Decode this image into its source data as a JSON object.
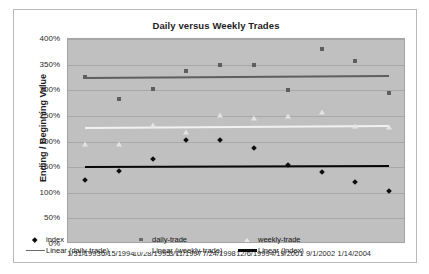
{
  "chart_data": {
    "type": "scatter",
    "title": "Daily versus Weekly Trades",
    "xlabel": "",
    "ylabel": "Ending / Beginning Value",
    "ylim": [
      0,
      400
    ],
    "yunit": "%",
    "ytick_labels": [
      "400%",
      "350%",
      "300%",
      "250%",
      "200%",
      "150%",
      "100%",
      "50%",
      "0%"
    ],
    "ytick_values": [
      400,
      350,
      300,
      250,
      200,
      150,
      100,
      50,
      0
    ],
    "xtick_labels": [
      "1/31/1993",
      "6/15/1994",
      "10/28/1995",
      "3/11/1997",
      "7/24/1998",
      "12/6/1999",
      "4/19/2001",
      "9/1/2002",
      "1/14/2004"
    ],
    "grid": true,
    "legend_position": "bottom-inside",
    "plot_background": "#c0c0c0",
    "x": [
      0.5,
      1.5,
      2.5,
      3.5,
      4.5,
      5.5,
      6.5,
      7.5,
      8.5,
      9.5
    ],
    "series": [
      {
        "name": "index",
        "marker": "diamond",
        "color": "#0d0d0d",
        "values": [
          124,
          142,
          165,
          203,
          203,
          188,
          154,
          141,
          121,
          103
        ]
      },
      {
        "name": "daily-trade",
        "marker": "square",
        "color": "#5e5e5e",
        "values": [
          325,
          283,
          302,
          338,
          350,
          350,
          300,
          381,
          358,
          295
        ]
      },
      {
        "name": "weekly-trade",
        "marker": "triangle",
        "color": "#e3e3e3",
        "values": [
          196,
          196,
          232,
          219,
          251,
          245,
          250,
          258,
          230,
          228
        ]
      }
    ],
    "trendlines": [
      {
        "name": "Linear (daily-trade)",
        "color": "#5e5e5e",
        "x0": 0.5,
        "y0": 325,
        "x1": 9.5,
        "y1": 329
      },
      {
        "name": "Linear (weekly-trade)",
        "color": "#f2f2f2",
        "x0": 0.5,
        "y0": 228,
        "x1": 9.5,
        "y1": 232
      },
      {
        "name": "Linear (index)",
        "color": "#080808",
        "x0": 0.5,
        "y0": 153,
        "x1": 9.5,
        "y1": 155
      }
    ]
  },
  "legend": {
    "row1": [
      {
        "label": "index",
        "key": "diamond-marker-icon"
      },
      {
        "label": "daily-trade",
        "key": "square-marker-icon"
      },
      {
        "label": "weekly-trade",
        "key": "triangle-marker-icon"
      }
    ],
    "row2": [
      {
        "label": "Linear (daily-trade)",
        "key": "line-swatch-icon"
      },
      {
        "label": "Linear (weekly-trade)",
        "key": "line-swatch-icon"
      },
      {
        "label": "Linear (index)",
        "key": "line-swatch-icon"
      }
    ]
  }
}
